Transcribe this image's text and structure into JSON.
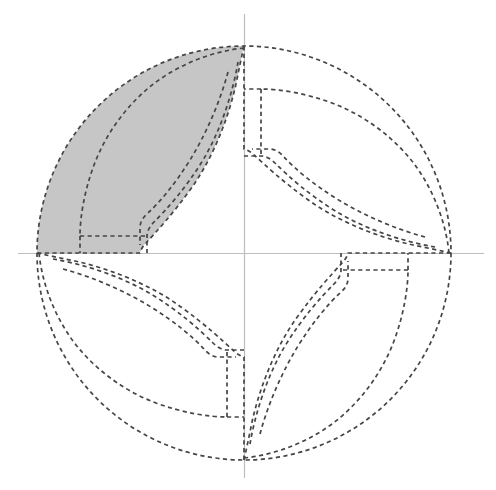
{
  "figure": {
    "title": "Dashed spiral pinwheel partition of a disk with one shaded arm",
    "type": "geometric-diagram",
    "canvas": {
      "width": 496,
      "height": 490,
      "background": "#ffffff"
    },
    "circle": {
      "center_x": 244,
      "center_y": 253,
      "radius": 207,
      "style": "dashed",
      "stroke": "#454545"
    },
    "axes": {
      "horizontal": {
        "y": 253,
        "x_start": 18,
        "x_end": 484,
        "color": "#bdbdbd"
      },
      "vertical": {
        "x": 244,
        "y_start": 14,
        "y_end": 478,
        "color": "#bdbdbd"
      }
    },
    "symmetry": {
      "fold": 4,
      "rotation_step_degrees": 90
    },
    "arms": [
      {
        "name": "arm-top-left",
        "rotation": 0,
        "shaded": true
      },
      {
        "name": "arm-top-right",
        "rotation": 90,
        "shaded": false
      },
      {
        "name": "arm-bottom-right",
        "rotation": 180,
        "shaded": false
      },
      {
        "name": "arm-bottom-left",
        "rotation": 270,
        "shaded": false
      }
    ],
    "shaded_arm": {
      "name": "arm-top-left",
      "fill": "#c6c6c6",
      "description": "crescent band from top of circle sweeping counterclockwise to the left end of the horizontal axis"
    },
    "stroke_style": {
      "dash_on": 4.2,
      "dash_off": 3.4,
      "width": 1.7,
      "color": "#454545"
    },
    "nested_levels": 3
  }
}
